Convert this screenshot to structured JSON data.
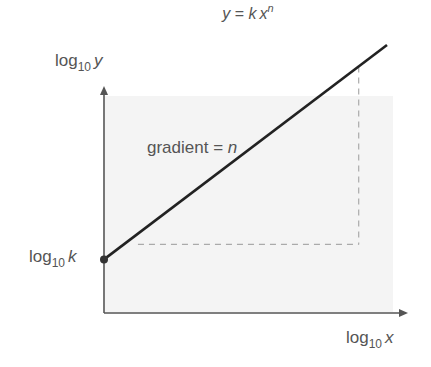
{
  "title": {
    "lhs": "y",
    "eq": " = ",
    "k": "k",
    "x": "x",
    "exp": "n"
  },
  "y_axis_label": {
    "log": "log",
    "base": "10",
    "var": "y"
  },
  "x_axis_label": {
    "log": "log",
    "base": "10",
    "var": "x"
  },
  "intercept_label": {
    "log": "log",
    "base": "10",
    "var": "k"
  },
  "gradient_label": {
    "text": "gradient = ",
    "var": "n"
  },
  "colors": {
    "axis": "#555555",
    "line": "#222222",
    "shade": "#f4f4f4",
    "dash": "#aaaaaa",
    "text": "#555555"
  },
  "chart_data": {
    "type": "line",
    "xlabel": "log10 x",
    "ylabel": "log10 y",
    "annotations": [
      "gradient = n",
      "log10 k (y-intercept)"
    ],
    "series": [
      {
        "name": "log10 y = n log10 x + log10 k",
        "x": [
          0,
          1
        ],
        "y": [
          0.2,
          1.0
        ]
      }
    ],
    "xlim": [
      0,
      1.08
    ],
    "ylim": [
      0,
      1.05
    ],
    "intercept": 0.2,
    "triangle_corner": {
      "x": 0.9,
      "y": 0.2
    },
    "grid": false
  }
}
